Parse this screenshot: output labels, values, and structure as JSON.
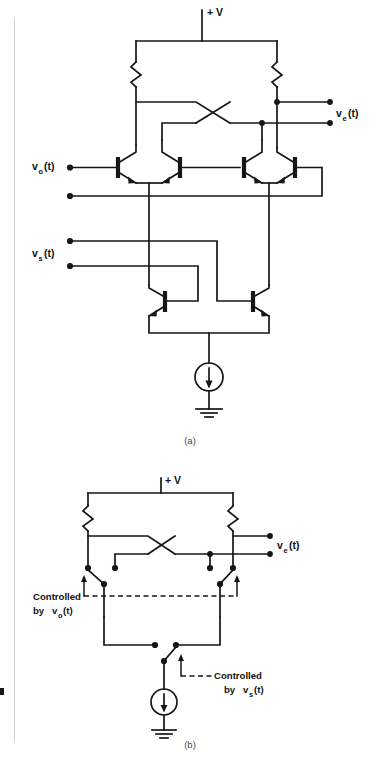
{
  "figure": {
    "page_background": "#ffffff",
    "ink_color": "#161616",
    "gutter_color": "#d2d2d2",
    "captions": {
      "part_a": "(a)",
      "part_b": "(b)"
    }
  },
  "diagram_a": {
    "name": "Gilbert cell multiplier transistor schematic",
    "supply_label": "+ V",
    "input_lower_label": "v",
    "input_lower_sub": "o",
    "input_lower_arg": "(t)",
    "input_upper_label": "v",
    "input_upper_sub": "s",
    "input_upper_arg": "(t)",
    "output_label": "v",
    "output_sub": "e",
    "output_arg": "(t)",
    "component_counts": {
      "resistors": 2,
      "transistors": 6,
      "current_sources": 1,
      "ground_symbols": 1
    }
  },
  "diagram_b": {
    "name": "Switch equivalent model",
    "supply_label": "+ V",
    "output_label": "v",
    "output_sub": "e",
    "output_arg": "(t)",
    "control_top_line1": "Controlled",
    "control_top_line2": "by",
    "control_top_var": "v",
    "control_top_sub": "o",
    "control_top_arg": "(t)",
    "control_bottom_line1": "Controlled",
    "control_bottom_line2": "by",
    "control_bottom_var": "v",
    "control_bottom_sub": "s",
    "control_bottom_arg": "(t)",
    "component_counts": {
      "resistors": 2,
      "switches": 3,
      "current_sources": 1,
      "ground_symbols": 1
    }
  }
}
